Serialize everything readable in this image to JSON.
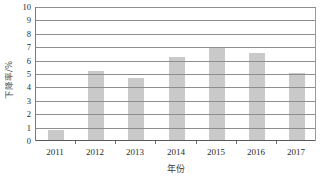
{
  "chart_data": {
    "type": "bar",
    "title": "",
    "subtitle": "",
    "xlabel": "年份",
    "ylabel": "下降率/%",
    "categories": [
      "2011",
      "2012",
      "2013",
      "2014",
      "2015",
      "2016",
      "2017"
    ],
    "values": [
      0.8,
      5.2,
      4.7,
      6.3,
      7.0,
      6.6,
      5.1
    ],
    "series": [
      {
        "name": "下降率",
        "values": [
          0.8,
          5.2,
          4.7,
          6.3,
          7.0,
          6.6,
          5.1
        ]
      }
    ],
    "ylim": [
      0,
      10
    ],
    "xlim_categories": 7,
    "y_ticks": [
      0,
      1,
      2,
      3,
      4,
      5,
      6,
      7,
      8,
      9,
      10
    ],
    "y_tick_labels": [
      "0",
      "1",
      "2",
      "3",
      "4",
      "5",
      "6",
      "7",
      "8",
      "9",
      "10"
    ],
    "grid": true,
    "grid_orientation": "horizontal",
    "legend": false,
    "legend_position": "none",
    "annotations": [],
    "colors": {
      "bar_fill": "#c9c9c9",
      "gridline": "#8d8d8d",
      "axis_line": "#5a5a5a",
      "text": "#2b2b2b",
      "background": "#ffffff"
    }
  }
}
